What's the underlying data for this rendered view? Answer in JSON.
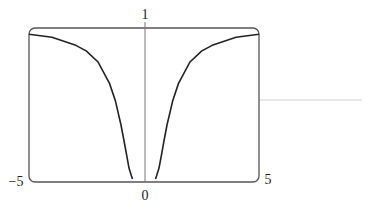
{
  "chart_data": {
    "type": "line",
    "title": "",
    "xlabel": "",
    "ylabel": "",
    "xlim": [
      -5,
      5
    ],
    "ylim": [
      0,
      1
    ],
    "grid": false,
    "legend": null,
    "tick_labels": {
      "x_left": "−5",
      "x_right": "5",
      "x_origin": "0",
      "y_top": "1"
    },
    "series": [
      {
        "name": "y = e^(-1/x^2)",
        "x": [
          -5,
          -4,
          -3,
          -2.5,
          -2,
          -1.5,
          -1.25,
          -1,
          -0.85,
          -0.75,
          -0.65,
          -0.55,
          -0.5,
          0.5,
          0.55,
          0.65,
          0.75,
          0.85,
          1,
          1.25,
          1.5,
          2,
          2.5,
          3,
          4,
          5
        ],
        "y": [
          0.96,
          0.94,
          0.89,
          0.85,
          0.78,
          0.64,
          0.53,
          0.37,
          0.25,
          0.17,
          0.09,
          0.04,
          0.02,
          0.02,
          0.04,
          0.09,
          0.17,
          0.25,
          0.37,
          0.53,
          0.64,
          0.78,
          0.85,
          0.89,
          0.94,
          0.96
        ]
      }
    ],
    "colors": {
      "curve": "#222222",
      "frame": "#555555",
      "axis": "#777777",
      "stray_line": "#cccccc"
    }
  }
}
